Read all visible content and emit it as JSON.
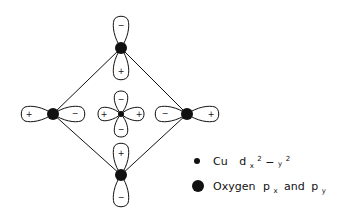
{
  "diagram": {
    "title": "",
    "colors": {
      "stroke": "#111111",
      "fill_atom": "#111111",
      "background": "#ffffff"
    },
    "cu_center": {
      "label": "Cu",
      "orbital": "d x2-y2",
      "lobe_signs": {
        "top": "−",
        "bottom": "−",
        "left": "+",
        "right": "+"
      }
    },
    "oxygen_atoms": [
      {
        "position": "top",
        "orbital": "p",
        "lobe_signs": {
          "outer": "−",
          "inner": "+"
        }
      },
      {
        "position": "left",
        "orbital": "p",
        "lobe_signs": {
          "outer": "+",
          "inner": "−"
        }
      },
      {
        "position": "right",
        "orbital": "p",
        "lobe_signs": {
          "outer": "+",
          "inner": "−"
        }
      },
      {
        "position": "bottom",
        "orbital": "p",
        "lobe_signs": {
          "outer": "−",
          "inner": "+"
        }
      }
    ]
  },
  "legend": {
    "items": [
      {
        "marker": "small-dot",
        "label": "Cu",
        "orbital_main": "d",
        "orbital_sub": "x",
        "sup1": "2",
        "dash": "−",
        "sub2": "y",
        "sup2": "2"
      },
      {
        "marker": "large-dot",
        "label": "Oxygen",
        "p1": "p",
        "p1_sub": "x",
        "conj": "and",
        "p2": "p",
        "p2_sub": "y"
      }
    ]
  }
}
